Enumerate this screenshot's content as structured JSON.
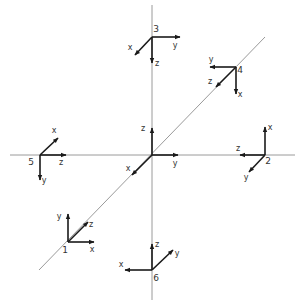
{
  "diagram": {
    "colors": {
      "reference_lines": "#9a9a9a",
      "vectors": "#1a1a1a",
      "text": "#333333"
    },
    "reference_lines": [
      {
        "name": "horizontal",
        "x1": 10,
        "y1": 155,
        "x2": 295,
        "y2": 155
      },
      {
        "name": "vertical",
        "x1": 152,
        "y1": 5,
        "x2": 152,
        "y2": 300
      },
      {
        "name": "diagonal",
        "x1": 39,
        "y1": 270,
        "x2": 265,
        "y2": 37
      }
    ],
    "frames": [
      {
        "id": "origin",
        "label": "",
        "ox": 152,
        "oy": 155,
        "axes": [
          {
            "name": "z",
            "x": 152,
            "y": 128,
            "lx": 143,
            "ly": 131
          },
          {
            "name": "y",
            "x": 178,
            "y": 155,
            "lx": 175,
            "ly": 166
          },
          {
            "name": "x",
            "x": 132,
            "y": 175,
            "lx": 128,
            "ly": 171
          }
        ]
      },
      {
        "id": "frame-1",
        "label": "1",
        "ox": 68,
        "oy": 242,
        "nx": 65,
        "ny": 253,
        "axes": [
          {
            "name": "y",
            "x": 68,
            "y": 214,
            "lx": 59,
            "ly": 219
          },
          {
            "name": "x",
            "x": 94,
            "y": 242,
            "lx": 92,
            "ly": 252
          },
          {
            "name": "z",
            "x": 88,
            "y": 222,
            "lx": 91,
            "ly": 227
          }
        ]
      },
      {
        "id": "frame-2",
        "label": "2",
        "ox": 265,
        "oy": 155,
        "nx": 268,
        "ny": 164,
        "axes": [
          {
            "name": "x",
            "x": 265,
            "y": 127,
            "lx": 270,
            "ly": 130
          },
          {
            "name": "z",
            "x": 240,
            "y": 155,
            "lx": 238,
            "ly": 151
          },
          {
            "name": "y",
            "x": 249,
            "y": 172,
            "lx": 246,
            "ly": 180
          }
        ]
      },
      {
        "id": "frame-3",
        "label": "3",
        "ox": 152,
        "oy": 37,
        "nx": 156,
        "ny": 32,
        "axes": [
          {
            "name": "y",
            "x": 180,
            "y": 37,
            "lx": 175,
            "ly": 48
          },
          {
            "name": "x",
            "x": 135,
            "y": 55,
            "lx": 130,
            "ly": 50
          },
          {
            "name": "z",
            "x": 152,
            "y": 63,
            "lx": 157,
            "ly": 66
          }
        ]
      },
      {
        "id": "frame-4",
        "label": "4",
        "ox": 236,
        "oy": 67,
        "nx": 240,
        "ny": 73,
        "axes": [
          {
            "name": "y",
            "x": 210,
            "y": 67,
            "lx": 211,
            "ly": 62
          },
          {
            "name": "x",
            "x": 236,
            "y": 94,
            "lx": 240,
            "ly": 97
          },
          {
            "name": "z",
            "x": 216,
            "y": 87,
            "lx": 210,
            "ly": 84
          }
        ]
      },
      {
        "id": "frame-5",
        "label": "5",
        "ox": 40,
        "oy": 155,
        "nx": 31,
        "ny": 165,
        "axes": [
          {
            "name": "z",
            "x": 66,
            "y": 155,
            "lx": 61,
            "ly": 165
          },
          {
            "name": "y",
            "x": 40,
            "y": 180,
            "lx": 44,
            "ly": 183
          },
          {
            "name": "x",
            "x": 58,
            "y": 138,
            "lx": 54,
            "ly": 133
          }
        ]
      },
      {
        "id": "frame-6",
        "label": "6",
        "ox": 152,
        "oy": 270,
        "nx": 156,
        "ny": 281,
        "axes": [
          {
            "name": "z",
            "x": 152,
            "y": 244,
            "lx": 157,
            "ly": 247
          },
          {
            "name": "y",
            "x": 173,
            "y": 250,
            "lx": 177,
            "ly": 256
          },
          {
            "name": "x",
            "x": 125,
            "y": 270,
            "lx": 121,
            "ly": 267
          }
        ]
      }
    ]
  }
}
